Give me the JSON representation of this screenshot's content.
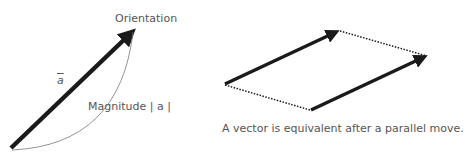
{
  "left_diagram": {
    "orientation_label": "Orientation",
    "vector_symbol": "a",
    "magnitude_label": "Magnitude",
    "magnitude_notation": "| a |"
  },
  "right_diagram": {
    "caption": "A vector is equivalent after a parallel move."
  },
  "colors": {
    "arrow": "#1a1a1a",
    "text": "#555555",
    "curve": "#777777"
  }
}
